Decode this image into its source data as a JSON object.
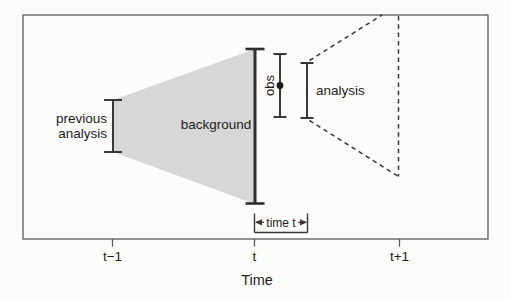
{
  "diagram": {
    "colors": {
      "background": "#fcfcfb",
      "line": "#383838",
      "spread_fill": "#d7d7d7"
    },
    "labels": {
      "previous_analysis_line1": "previous",
      "previous_analysis_line2": "analysis",
      "background_region": "background",
      "obs": "obs",
      "analysis": "analysis",
      "time_window": "time t"
    },
    "axis": {
      "title": "Time",
      "ticks": [
        {
          "label": "t−1"
        },
        {
          "label": "t"
        },
        {
          "label": "t+1"
        }
      ]
    }
  }
}
